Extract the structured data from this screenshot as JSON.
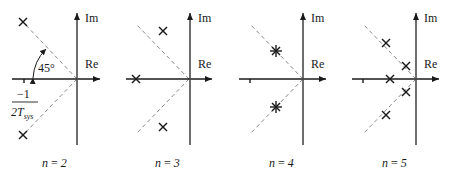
{
  "figure": {
    "axis_labels": {
      "imag": "Im",
      "real": "Re"
    },
    "angle_label": "45°",
    "pole_label": {
      "numerator": "−1",
      "denominator_T": "2T",
      "denominator_sub": "sys"
    },
    "panels": [
      {
        "id": "n2",
        "caption": "n = 2",
        "n_label": "n",
        "n_value": "2",
        "poles": [
          {
            "type": "single",
            "position": "upper-45deg"
          },
          {
            "type": "single",
            "position": "lower-45deg"
          }
        ]
      },
      {
        "id": "n3",
        "caption": "n = 3",
        "n_label": "n",
        "n_value": "3",
        "poles": [
          {
            "type": "single",
            "position": "real-axis"
          },
          {
            "type": "single",
            "position": "upper"
          },
          {
            "type": "single",
            "position": "lower"
          }
        ]
      },
      {
        "id": "n4",
        "caption": "n = 4",
        "n_label": "n",
        "n_value": "4",
        "poles": [
          {
            "type": "double",
            "position": "upper-45deg"
          },
          {
            "type": "double",
            "position": "lower-45deg"
          }
        ]
      },
      {
        "id": "n5",
        "caption": "n = 5",
        "n_label": "n",
        "n_value": "5",
        "poles": [
          {
            "type": "single",
            "position": "real-axis"
          },
          {
            "type": "single",
            "position": "upper-far"
          },
          {
            "type": "single",
            "position": "upper-near"
          },
          {
            "type": "single",
            "position": "lower-near"
          },
          {
            "type": "single",
            "position": "lower-far"
          }
        ]
      }
    ]
  }
}
